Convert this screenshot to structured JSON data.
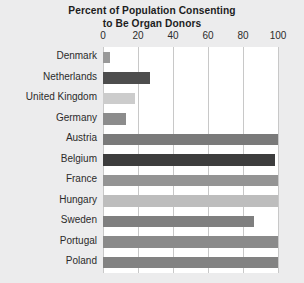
{
  "chart_data": {
    "type": "bar",
    "orientation": "horizontal",
    "title": "Percent of Population Consenting to Be Organ Donors",
    "title_line1": "Percent of Population Consenting",
    "title_line2": "to Be Organ Donors",
    "xlabel": "",
    "ylabel": "",
    "xlim": [
      0,
      100
    ],
    "xticks": [
      0,
      20,
      40,
      60,
      80,
      100
    ],
    "xtick_labels": [
      "0",
      "20",
      "40",
      "60",
      "80",
      "100"
    ],
    "grid": "vertical",
    "legend": "none",
    "categories": [
      "Denmark",
      "Netherlands",
      "United Kingdom",
      "Germany",
      "Austria",
      "Belgium",
      "France",
      "Hungary",
      "Sweden",
      "Portugal",
      "Poland"
    ],
    "values": [
      4,
      27,
      18,
      13,
      100,
      98,
      100,
      100,
      86,
      100,
      100
    ],
    "bars": [
      {
        "label": "Denmark",
        "value": 4,
        "color": "#999999"
      },
      {
        "label": "Netherlands",
        "value": 27,
        "color": "#4d4d4d"
      },
      {
        "label": "United Kingdom",
        "value": 18,
        "color": "#cccccc"
      },
      {
        "label": "Germany",
        "value": 13,
        "color": "#8c8c8c"
      },
      {
        "label": "Austria",
        "value": 100,
        "color": "#7a7a7a"
      },
      {
        "label": "Belgium",
        "value": 98,
        "color": "#3d3d3d"
      },
      {
        "label": "France",
        "value": 100,
        "color": "#949494"
      },
      {
        "label": "Hungary",
        "value": 100,
        "color": "#bdbdbd"
      },
      {
        "label": "Sweden",
        "value": 86,
        "color": "#7f7f7f"
      },
      {
        "label": "Portugal",
        "value": 100,
        "color": "#8a8a8a"
      },
      {
        "label": "Poland",
        "value": 100,
        "color": "#828282"
      }
    ]
  },
  "colors": {
    "background": "#ececed",
    "plot_background": "#ffffff",
    "gridline": "#c8c8c8",
    "text": "#2b2b2b"
  }
}
